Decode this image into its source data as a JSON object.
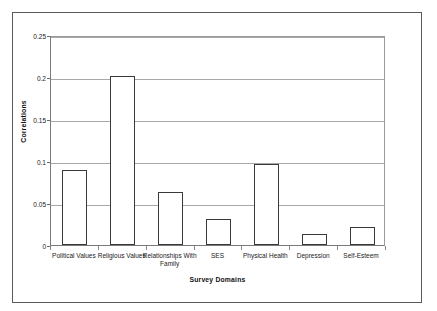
{
  "chart_data": {
    "type": "bar",
    "title": "",
    "subtitle": "",
    "xlabel": "Survey Domains",
    "ylabel": "Correlations",
    "categories": [
      "Political Values",
      "Religious Values",
      "Relationships With Family",
      "SES",
      "Physical Health",
      "Depression",
      "Self-Esteem"
    ],
    "values": [
      0.089,
      0.201,
      0.063,
      0.031,
      0.097,
      0.013,
      0.021
    ],
    "ylim": [
      0,
      0.25
    ],
    "yticks": [
      0,
      0.05,
      0.1,
      0.15,
      0.2,
      0.25
    ],
    "ytick_labels": [
      "0",
      "0.05",
      "0.1",
      "0.15",
      "0.2",
      "0.25"
    ],
    "grid": true,
    "grid_axis": "y",
    "legend": false,
    "legend_position": "none",
    "bar_fill": "#ffffff",
    "bar_edge_color": "#3a3a3a",
    "gridline_color": "#a8a8a8",
    "axis_color": "#7a7a7a",
    "frame_color": "#5a5a5a",
    "background": "#ffffff",
    "text_color": "#1a1a1a"
  },
  "figure": {
    "y_axis_title": "Correlations",
    "x_axis_title": "Survey Domains"
  }
}
